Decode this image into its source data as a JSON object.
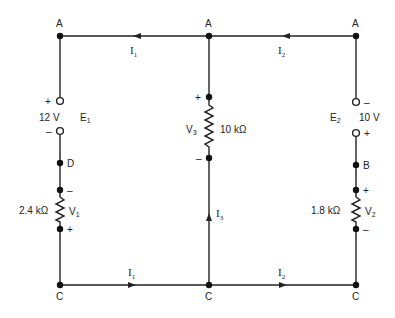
{
  "diagram": {
    "type": "circuit-schematic",
    "nodes": {
      "top_left": "A",
      "top_center": "A",
      "top_right": "A",
      "bottom_left": "C",
      "bottom_center": "C",
      "bottom_right": "C",
      "left_mid": "D",
      "right_mid": "B"
    },
    "sources": [
      {
        "name": "E",
        "sub": "1",
        "value": "12 V",
        "plus": "+",
        "minus": "–"
      },
      {
        "name": "E",
        "sub": "2",
        "value": "10 V",
        "plus": "+",
        "minus": "–"
      }
    ],
    "resistors": [
      {
        "name": "V",
        "sub": "1",
        "value": "2.4 kΩ",
        "plus": "+",
        "minus": "–"
      },
      {
        "name": "V",
        "sub": "3",
        "value": "10 kΩ",
        "plus": "+",
        "minus": "–"
      },
      {
        "name": "V",
        "sub": "2",
        "value": "1.8 kΩ",
        "plus": "+",
        "minus": "–"
      }
    ],
    "currents": {
      "top_left": {
        "name": "I",
        "sub": "1"
      },
      "top_right": {
        "name": "I",
        "sub": "2"
      },
      "center": {
        "name": "I",
        "sub": "3"
      },
      "bottom_left": {
        "name": "I",
        "sub": "1"
      },
      "bottom_right": {
        "name": "I",
        "sub": "2"
      }
    }
  }
}
